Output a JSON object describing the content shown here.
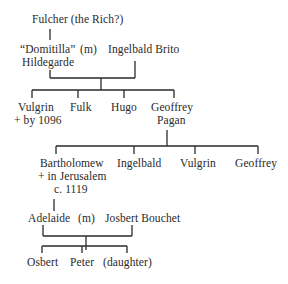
{
  "diagram": {
    "type": "genealogy-tree",
    "generation_1": {
      "founder": "Fulcher (the Rich?)"
    },
    "generation_2": {
      "wife_line1": "“Domitilla”",
      "wife_line2": "Hildegarde",
      "marriage_marker": "(m)",
      "husband": "Ingelbald Brito"
    },
    "generation_3": {
      "children": [
        {
          "name": "Vulgrin",
          "note": "+ by 1096"
        },
        {
          "name": "Fulk"
        },
        {
          "name": "Hugo"
        },
        {
          "name": "Geoffrey",
          "name_line2": "Pagan"
        }
      ]
    },
    "generation_4": {
      "children": [
        {
          "name": "Bartholomew",
          "note_line1": "+ in Jerusalem",
          "note_line2": "c. 1119"
        },
        {
          "name": "Ingelbald"
        },
        {
          "name": "Vulgrin"
        },
        {
          "name": "Geoffrey"
        }
      ]
    },
    "generation_5": {
      "wife": "Adelaide",
      "marriage_marker": "(m)",
      "husband": "Josbert Bouchet"
    },
    "generation_6": {
      "children": [
        {
          "name": "Osbert"
        },
        {
          "name": "Peter"
        },
        {
          "name": "(daughter)"
        }
      ]
    }
  }
}
